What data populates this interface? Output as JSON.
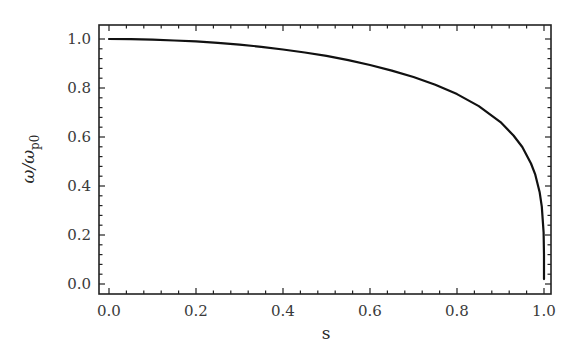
{
  "chart_data": {
    "type": "line",
    "title": "",
    "xlabel": "s",
    "ylabel": "ω/ω_p0",
    "ylabel_parts": {
      "main": "ω/ω",
      "sub": "p0"
    },
    "xlim": [
      -0.02,
      1.02
    ],
    "ylim": [
      -0.04,
      1.06
    ],
    "x_ticks": [
      0.0,
      0.2,
      0.4,
      0.6,
      0.8,
      1.0
    ],
    "x_tick_labels": [
      "0.0",
      "0.2",
      "0.4",
      "0.6",
      "0.8",
      "1.0"
    ],
    "y_ticks": [
      0.0,
      0.2,
      0.4,
      0.6,
      0.8,
      1.0
    ],
    "y_tick_labels": [
      "0.0",
      "0.2",
      "0.4",
      "0.6",
      "0.8",
      "1.0"
    ],
    "grid": false,
    "legend": null,
    "frame": "box",
    "series": [
      {
        "name": "ω/ω_p0",
        "color": "#111111",
        "x": [
          0.0,
          0.05,
          0.1,
          0.15,
          0.2,
          0.25,
          0.3,
          0.35,
          0.4,
          0.45,
          0.5,
          0.55,
          0.6,
          0.65,
          0.7,
          0.75,
          0.8,
          0.85,
          0.9,
          0.93,
          0.95,
          0.97,
          0.98,
          0.99,
          0.995,
          0.999,
          0.9999
        ],
        "y": [
          1.0,
          0.999,
          0.997,
          0.994,
          0.99,
          0.984,
          0.977,
          0.968,
          0.957,
          0.945,
          0.931,
          0.914,
          0.894,
          0.871,
          0.845,
          0.813,
          0.775,
          0.726,
          0.661,
          0.606,
          0.559,
          0.492,
          0.446,
          0.376,
          0.316,
          0.211,
          0.119
        ]
      }
    ]
  }
}
